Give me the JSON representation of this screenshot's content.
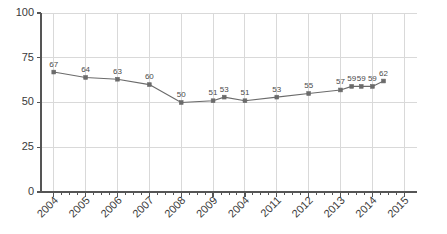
{
  "chart_data": {
    "type": "line",
    "title": "",
    "subtitle": "",
    "xlabel": "",
    "ylabel": "",
    "xlim": [
      2003.6,
      2015.4
    ],
    "ylim": [
      0,
      100
    ],
    "grid": true,
    "legend": false,
    "legend_position": "none",
    "y_ticks": [
      "0",
      "25",
      "50",
      "75",
      "100"
    ],
    "y_tick_values": [
      0,
      25,
      50,
      75,
      100
    ],
    "x_ticks": [
      "2004",
      "2005",
      "2006",
      "2007",
      "2008",
      "2009",
      "2004",
      "2011",
      "2012",
      "2013",
      "2014",
      "2015"
    ],
    "x_tick_values": [
      2004,
      2005,
      2006,
      2007,
      2008,
      2009,
      2010,
      2011,
      2012,
      2013,
      2014,
      2015
    ],
    "x_tick_rotation": -45,
    "series": [
      {
        "name": "series-1",
        "marker": "square",
        "color": "#6b6b6b",
        "x": [
          2004.0,
          2005.0,
          2006.0,
          2007.0,
          2008.0,
          2009.0,
          2009.35,
          2010.0,
          2011.0,
          2012.0,
          2013.0,
          2013.35,
          2013.65,
          2014.0,
          2014.35
        ],
        "values": [
          67,
          64,
          63,
          60,
          50,
          51,
          53,
          51,
          53,
          55,
          57,
          59,
          59,
          59,
          62
        ],
        "data_labels": [
          "67",
          "64",
          "63",
          "60",
          "50",
          "51",
          "53",
          "51",
          "53",
          "55",
          "57",
          "59",
          "59",
          "59",
          "62"
        ]
      }
    ],
    "colors": {
      "line": "#6b6b6b",
      "marker": "#6b6b6b",
      "grid": "#d9d9d9",
      "axis": "#555555",
      "text": "#3a3a3a",
      "data_label": "#4a4a4a",
      "background": "#ffffff"
    }
  },
  "layout": {
    "plot_left": 41,
    "plot_right": 417,
    "plot_top": 13,
    "plot_bottom": 192
  }
}
